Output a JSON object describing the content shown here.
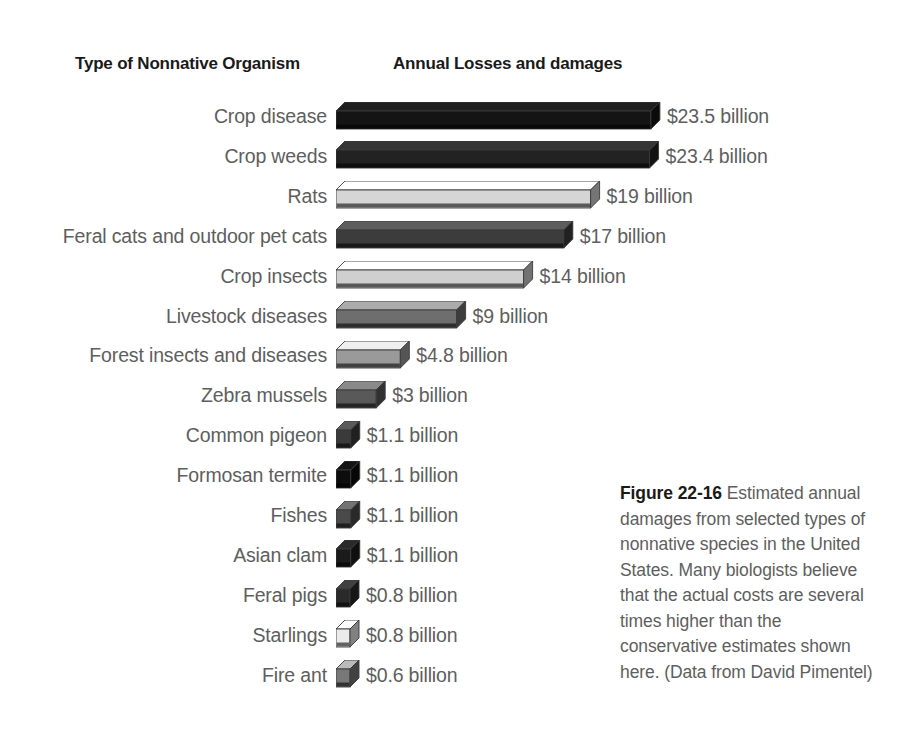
{
  "headers": {
    "left": "Type of Nonnative Organism",
    "right": "Annual Losses and damages"
  },
  "caption": {
    "figure_number": "Figure 22-16",
    "text": " Estimated annual damages from selected types of nonnative species in the United States. Many biologists believe that the actual costs are several times higher than the conservative estimates shown here. (Data from David Pimentel)"
  },
  "colors": {
    "text": "#5e5e5e",
    "heading": "#1a1a1a",
    "background": "#ffffff"
  },
  "chart_data": {
    "type": "bar",
    "orientation": "horizontal",
    "title": "Annual Losses and damages",
    "xlabel": "Annual Losses and damages",
    "ylabel": "Type of Nonnative Organism",
    "units": "billion US dollars",
    "grid": false,
    "legend": "none",
    "xlim": [
      0,
      23.5
    ],
    "categories": [
      "Crop disease",
      "Crop weeds",
      "Rats",
      "Feral cats and outdoor pet cats",
      "Crop insects",
      "Livestock diseases",
      "Forest insects and diseases",
      "Zebra mussels",
      "Common pigeon",
      "Formosan termite",
      "Fishes",
      "Asian clam",
      "Feral pigs",
      "Starlings",
      "Fire ant"
    ],
    "values": [
      23.5,
      23.4,
      19,
      17,
      14,
      9,
      4.8,
      3,
      1.1,
      1.1,
      1.1,
      1.1,
      0.8,
      0.8,
      0.6
    ],
    "value_labels": [
      "$23.5 billion",
      "$23.4 billion",
      "$19 billion",
      "$17 billion",
      "$14 billion",
      "$9 billion",
      "$4.8 billion",
      "$3 billion",
      "$1.1 billion",
      "$1.1 billion",
      "$1.1 billion",
      "$1.1 billion",
      "$0.8 billion",
      "$0.8 billion",
      "$0.6 billion"
    ],
    "bar_colors": [
      "#141414",
      "#222222",
      "#d5d5d5",
      "#3c3c3c",
      "#cfcfcf",
      "#6e6e6e",
      "#9a9a9a",
      "#595959",
      "#3a3a3a",
      "#0d0d0d",
      "#4a4a4a",
      "#1b1b1b",
      "#2a2a2a",
      "#ebebeb",
      "#787878"
    ]
  }
}
